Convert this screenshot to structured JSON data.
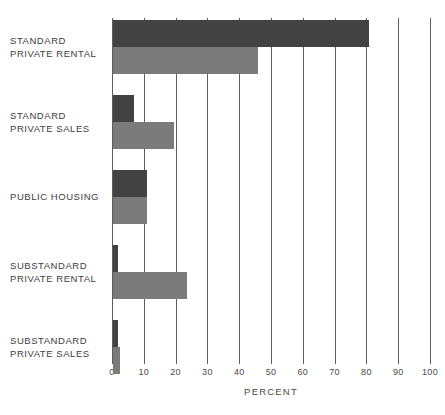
{
  "chart_data": {
    "type": "bar",
    "orientation": "horizontal",
    "title": "",
    "xlabel": "PERCENT",
    "ylabel": "",
    "xlim": [
      0,
      100
    ],
    "xticks": [
      0,
      10,
      20,
      30,
      40,
      50,
      60,
      70,
      80,
      90,
      100
    ],
    "xticklabels": [
      "0",
      "10",
      "20",
      "30",
      "40",
      "50",
      "60",
      "70",
      "80",
      "90",
      "100"
    ],
    "grid": true,
    "grid_axis": "x",
    "legend": "none",
    "categories": [
      "STANDARD\nPRIVATE RENTAL",
      "STANDARD\nPRIVATE SALES",
      "PUBLIC HOUSING",
      "SUBSTANDARD\nPRIVATE RENTAL",
      "SUBSTANDARD\nPRIVATE SALES"
    ],
    "series": [
      {
        "name": "dark",
        "color": "#424242",
        "values": [
          80.5,
          6.7,
          10.8,
          1.7,
          1.5
        ]
      },
      {
        "name": "light",
        "color": "#7b7b7b",
        "values": [
          45.7,
          19.3,
          10.8,
          23.2,
          2.3
        ]
      }
    ]
  },
  "axis": {
    "x_title": "PERCENT"
  },
  "colors": {
    "dark_bar": "#424242",
    "light_bar": "#7b7b7b",
    "gridline": "#5d5d5d",
    "text": "#3d3d3d",
    "background": "#ffffff"
  }
}
